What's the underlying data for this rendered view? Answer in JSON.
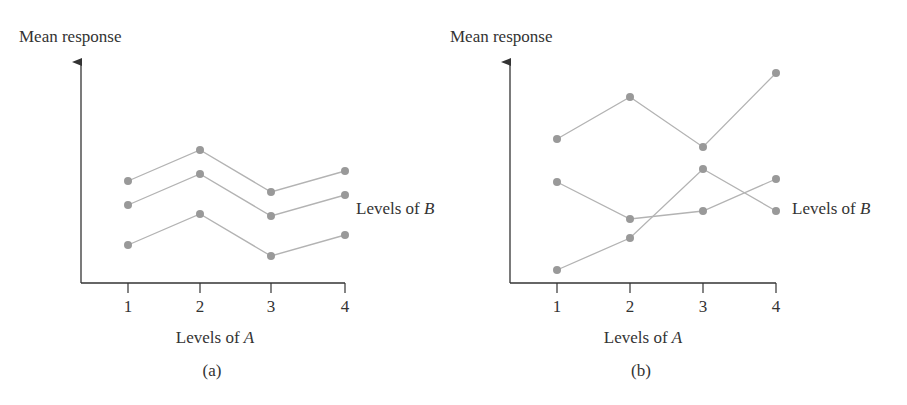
{
  "colors": {
    "axis": "#333333",
    "series_line": "#b3b3b3",
    "marker": "#999999",
    "text": "#333333",
    "background": "#ffffff"
  },
  "chart_data": [
    {
      "type": "line",
      "panel_label": "(a)",
      "title": "",
      "xlabel": "Levels of A",
      "xlabel_plain": "Levels of ",
      "xlabel_italic": "A",
      "ylabel": "Mean response",
      "series_label": "Levels of B",
      "series_label_plain": "Levels of ",
      "series_label_italic": "B",
      "categories": [
        "1",
        "2",
        "3",
        "4"
      ],
      "ylim": [
        0,
        22
      ],
      "y_ticks_shown": false,
      "grid": false,
      "legend_position": "right (single label 'Levels of B' adjacent to line ends)",
      "series": [
        {
          "name": "B level 1 (top)",
          "values": [
            10.2,
            13.3,
            9.1,
            11.2
          ]
        },
        {
          "name": "B level 2 (middle)",
          "values": [
            7.8,
            10.9,
            6.7,
            8.8
          ]
        },
        {
          "name": "B level 3 (bottom)",
          "values": [
            3.8,
            6.9,
            2.7,
            4.8
          ]
        }
      ],
      "annotation": "Parallel profiles — no interaction between A and B"
    },
    {
      "type": "line",
      "panel_label": "(b)",
      "title": "",
      "xlabel": "Levels of A",
      "xlabel_plain": "Levels of ",
      "xlabel_italic": "A",
      "ylabel": "Mean response",
      "series_label": "Levels of B",
      "series_label_plain": "Levels of ",
      "series_label_italic": "B",
      "categories": [
        "1",
        "2",
        "3",
        "4"
      ],
      "ylim": [
        0,
        22
      ],
      "y_ticks_shown": false,
      "grid": false,
      "legend_position": "right (single label 'Levels of B' adjacent to line ends)",
      "series": [
        {
          "name": "B level 1 (top)",
          "values": [
            14.4,
            18.6,
            13.6,
            21.0
          ]
        },
        {
          "name": "B level 2",
          "values": [
            10.1,
            6.4,
            7.2,
            10.4
          ]
        },
        {
          "name": "B level 3",
          "values": [
            1.3,
            4.5,
            11.4,
            7.2
          ]
        }
      ],
      "annotation": "Non-parallel, crossing profiles — interaction between A and B"
    }
  ],
  "layout": {
    "panels": [
      {
        "y_axis_x": 81,
        "x_axis_y": 283,
        "y_axis_top": 62,
        "x_axis_right": 345,
        "x_positions": [
          128,
          200,
          271,
          345
        ],
        "px_per_unit": 10,
        "ylabel_pos": [
          19,
          42
        ],
        "tick_label_y": 312,
        "xlabel_pos": [
          215,
          343
        ],
        "panel_label_pos": [
          212,
          376
        ],
        "series_label_pos": [
          356,
          214
        ]
      },
      {
        "y_axis_x": 510,
        "x_axis_y": 283,
        "y_axis_top": 62,
        "x_axis_right": 776,
        "x_positions": [
          557,
          630,
          703,
          776
        ],
        "px_per_unit": 10,
        "ylabel_pos": [
          450,
          42
        ],
        "tick_label_y": 312,
        "xlabel_pos": [
          643,
          343
        ],
        "panel_label_pos": [
          641,
          376
        ],
        "series_label_pos": [
          792,
          214
        ]
      }
    ]
  }
}
